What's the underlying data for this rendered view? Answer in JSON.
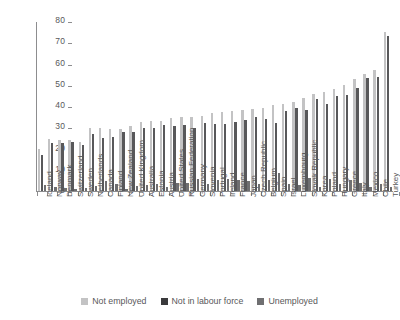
{
  "chart_data": {
    "type": "bar",
    "title": "",
    "subtitle": "",
    "xlabel": "",
    "ylabel": "",
    "ylim": [
      0,
      80
    ],
    "yticks": [
      0,
      10,
      20,
      30,
      40,
      50,
      60,
      70,
      80
    ],
    "grid": false,
    "legend_position": "bottom",
    "orientation": "vertical",
    "grouping": "grouped",
    "categories": [
      "Iceland",
      "Norway",
      "Denmark",
      "Switzerland",
      "Sweden",
      "Netherlands",
      "Canada",
      "Finland",
      "New Zealand",
      "United Kingdom",
      "Australia",
      "Estonia",
      "Austria",
      "United States",
      "Russian Federation",
      "Germany",
      "Slovenia",
      "Portugal",
      "Ireland",
      "France",
      "Japan",
      "Czech Republic",
      "Belgium",
      "Spain",
      "Israel",
      "Luxembourg",
      "Slovak Republic",
      "Korea",
      "Poland",
      "Hungary",
      "Greece",
      "Italy",
      "Mexico",
      "Chile",
      "Turkey"
    ],
    "series": [
      {
        "name": "Not employed",
        "color": "#c3c3c4",
        "values": [
          20.0,
          24.5,
          24.0,
          24.0,
          23.0,
          29.5,
          29.5,
          29.0,
          29.0,
          30.5,
          32.5,
          33.0,
          33.0,
          34.5,
          35.0,
          35.0,
          35.5,
          36.5,
          37.0,
          37.5,
          38.0,
          38.5,
          39.0,
          40.5,
          41.0,
          42.0,
          44.0,
          45.5,
          46.5,
          48.0,
          50.0,
          52.5,
          55.0,
          57.0,
          75.0
        ]
      },
      {
        "name": "Not in labour force",
        "color": "#58585a",
        "values": [
          17.0,
          22.5,
          22.5,
          23.0,
          21.5,
          27.0,
          25.0,
          25.5,
          28.0,
          28.0,
          29.5,
          29.5,
          31.0,
          30.5,
          31.0,
          29.5,
          32.0,
          31.5,
          31.5,
          32.5,
          33.5,
          35.0,
          34.0,
          32.0,
          37.5,
          39.0,
          38.0,
          43.5,
          41.0,
          44.5,
          45.0,
          48.5,
          53.0,
          53.5,
          73.0
        ]
      },
      {
        "name": "Unemployed",
        "color": "#6f6f71",
        "values": [
          3.0,
          2.0,
          1.5,
          1.0,
          1.5,
          2.5,
          4.5,
          3.5,
          1.0,
          2.5,
          3.0,
          3.5,
          2.0,
          4.0,
          4.0,
          5.5,
          3.5,
          5.0,
          5.5,
          5.0,
          4.5,
          3.5,
          5.0,
          8.5,
          3.5,
          3.0,
          6.0,
          2.0,
          5.5,
          3.5,
          5.0,
          4.0,
          2.0,
          3.5,
          2.0
        ]
      }
    ],
    "legend_entries": [
      "Not employed",
      "Not in labour force",
      "Unemployed"
    ]
  },
  "colors": {
    "not_employed": "#c3c3c4",
    "not_in_labour_force": "#58585a",
    "unemployed": "#6f6f71",
    "axis": "#8d8d8f",
    "text": "#58585a",
    "background": "#ffffff"
  }
}
